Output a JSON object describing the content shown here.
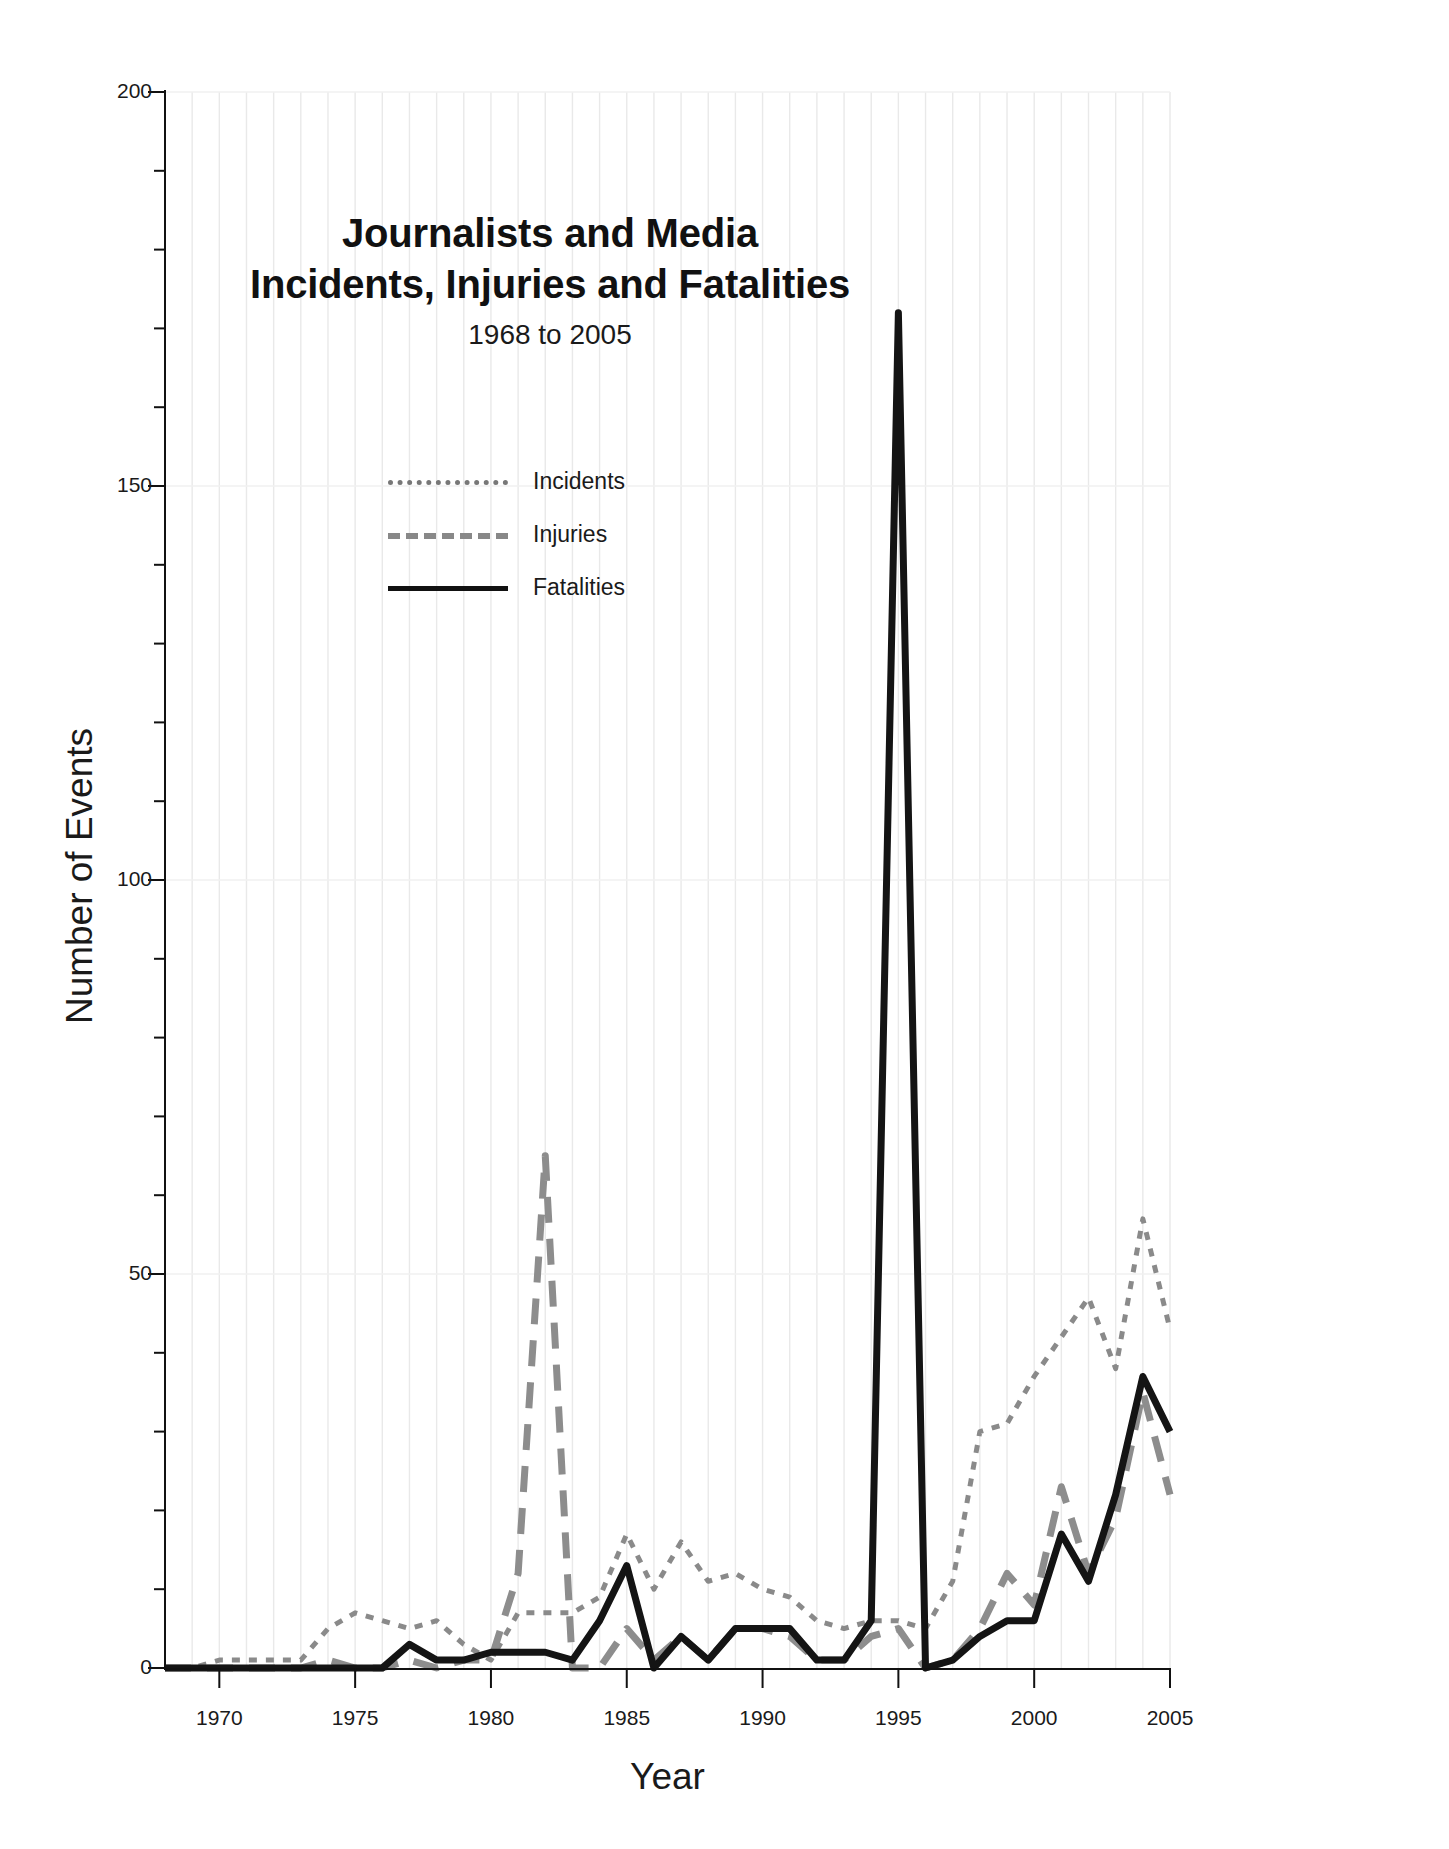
{
  "chart_data": {
    "type": "line",
    "title": "Journalists and Media Incidents, Injuries and Fatalities",
    "title_line1": "Journalists and Media",
    "title_line2": "Incidents, Injuries and Fatalities",
    "subtitle": "1968 to 2005",
    "xlabel": "Year",
    "ylabel": "Number of Events",
    "xlim": [
      1968,
      2005
    ],
    "ylim": [
      0,
      200
    ],
    "ytick_labels": [
      "0",
      "50",
      "100",
      "150",
      "200"
    ],
    "ytick_values": [
      0,
      50,
      100,
      150,
      200
    ],
    "yminor_step": 10,
    "xtick_labels": [
      "1970",
      "1975",
      "1980",
      "1985",
      "1990",
      "1995",
      "2000",
      "2005"
    ],
    "xtick_values": [
      1970,
      1975,
      1980,
      1985,
      1990,
      1995,
      2000,
      2005
    ],
    "grid": true,
    "legend_position": "upper-left-inside",
    "x": [
      1968,
      1969,
      1970,
      1971,
      1972,
      1973,
      1974,
      1975,
      1976,
      1977,
      1978,
      1979,
      1980,
      1981,
      1982,
      1983,
      1984,
      1985,
      1986,
      1987,
      1988,
      1989,
      1990,
      1991,
      1992,
      1993,
      1994,
      1995,
      1996,
      1997,
      1998,
      1999,
      2000,
      2001,
      2002,
      2003,
      2004,
      2005
    ],
    "series": [
      {
        "name": "Incidents",
        "style": "dotted",
        "color": "#8a8a8a",
        "values": [
          0,
          0,
          1,
          1,
          1,
          1,
          5,
          7,
          6,
          5,
          6,
          3,
          1,
          7,
          7,
          7,
          9,
          17,
          10,
          16,
          11,
          12,
          10,
          9,
          6,
          5,
          6,
          6,
          5,
          11,
          30,
          31,
          37,
          42,
          47,
          38,
          57,
          43
        ]
      },
      {
        "name": "Injuries",
        "style": "dashed",
        "color": "#8d8d8d",
        "values": [
          0,
          0,
          0,
          0,
          0,
          0,
          1,
          0,
          0,
          1,
          0,
          1,
          1,
          12,
          65,
          0,
          0,
          5,
          1,
          4,
          1,
          5,
          5,
          4,
          1,
          1,
          4,
          5,
          0,
          1,
          5,
          12,
          8,
          23,
          12,
          19,
          35,
          22
        ]
      },
      {
        "name": "Fatalities",
        "style": "solid",
        "color": "#141414",
        "values": [
          0,
          0,
          0,
          0,
          0,
          0,
          0,
          0,
          0,
          3,
          1,
          1,
          2,
          2,
          2,
          1,
          6,
          13,
          0,
          4,
          1,
          5,
          5,
          5,
          1,
          1,
          6,
          172,
          0,
          1,
          4,
          6,
          6,
          17,
          11,
          22,
          37,
          30
        ]
      }
    ]
  },
  "axes": {
    "ytitle": "Number of Events",
    "xtitle": "Year"
  },
  "legend": {
    "items": [
      {
        "label": "Incidents",
        "style": "dotted"
      },
      {
        "label": "Injuries",
        "style": "dashed"
      },
      {
        "label": "Fatalities",
        "style": "solid"
      }
    ]
  },
  "colors": {
    "incidents": "#8a8a8a",
    "injuries": "#8d8d8d",
    "fatalities": "#141414",
    "axis": "#111111",
    "grid": "#e9e9e9",
    "background": "#ffffff"
  }
}
